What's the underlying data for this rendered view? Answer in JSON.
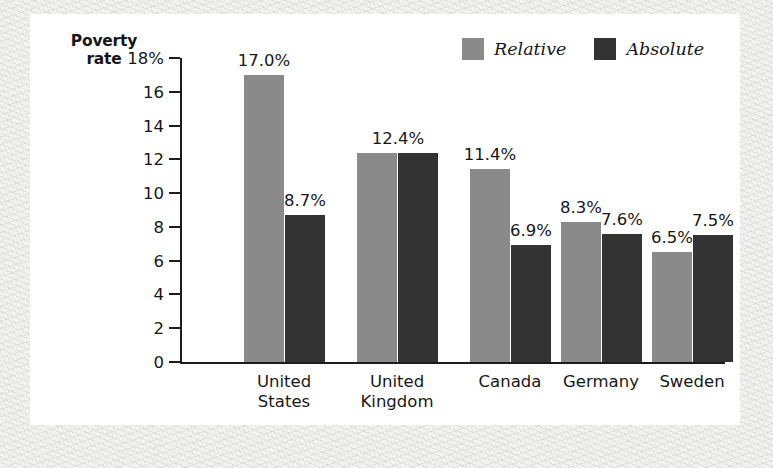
{
  "chart": {
    "y_axis_title_line1": "Poverty",
    "y_axis_title_line2": "rate",
    "legend": [
      {
        "label": "Relative",
        "color": "#8a8a8a"
      },
      {
        "label": "Absolute",
        "color": "#333333"
      }
    ]
  },
  "chart_data": {
    "type": "bar",
    "title": "",
    "subtitle": "",
    "xlabel": "",
    "ylabel": "Poverty rate",
    "ylim": [
      0,
      18
    ],
    "ytick_labels": [
      "0",
      "2",
      "4",
      "6",
      "8",
      "10",
      "12",
      "14",
      "16",
      "18%"
    ],
    "yticks": [
      0,
      2,
      4,
      6,
      8,
      10,
      12,
      14,
      16,
      18
    ],
    "grid": false,
    "legend_position": "top-right",
    "categories": [
      "United States",
      "United Kingdom",
      "Canada",
      "Germany",
      "Sweden"
    ],
    "category_lines": [
      [
        "United",
        "States"
      ],
      [
        "United",
        "Kingdom"
      ],
      [
        "Canada",
        ""
      ],
      [
        "Germany",
        ""
      ],
      [
        "Sweden",
        ""
      ]
    ],
    "series": [
      {
        "name": "Relative",
        "color": "#8a8a8a",
        "values": [
          17.0,
          12.4,
          11.4,
          8.3,
          6.5
        ],
        "value_labels": [
          "17.0%",
          "12.4%",
          "11.4%",
          "8.3%",
          "6.5%"
        ]
      },
      {
        "name": "Absolute",
        "color": "#333333",
        "values": [
          8.7,
          12.4,
          6.9,
          7.6,
          7.5
        ],
        "value_labels": [
          "8.7%",
          "12.4%",
          "6.9%",
          "7.6%",
          "7.5%"
        ]
      }
    ],
    "shared_labels": [
      false,
      true,
      false,
      false,
      false
    ]
  }
}
